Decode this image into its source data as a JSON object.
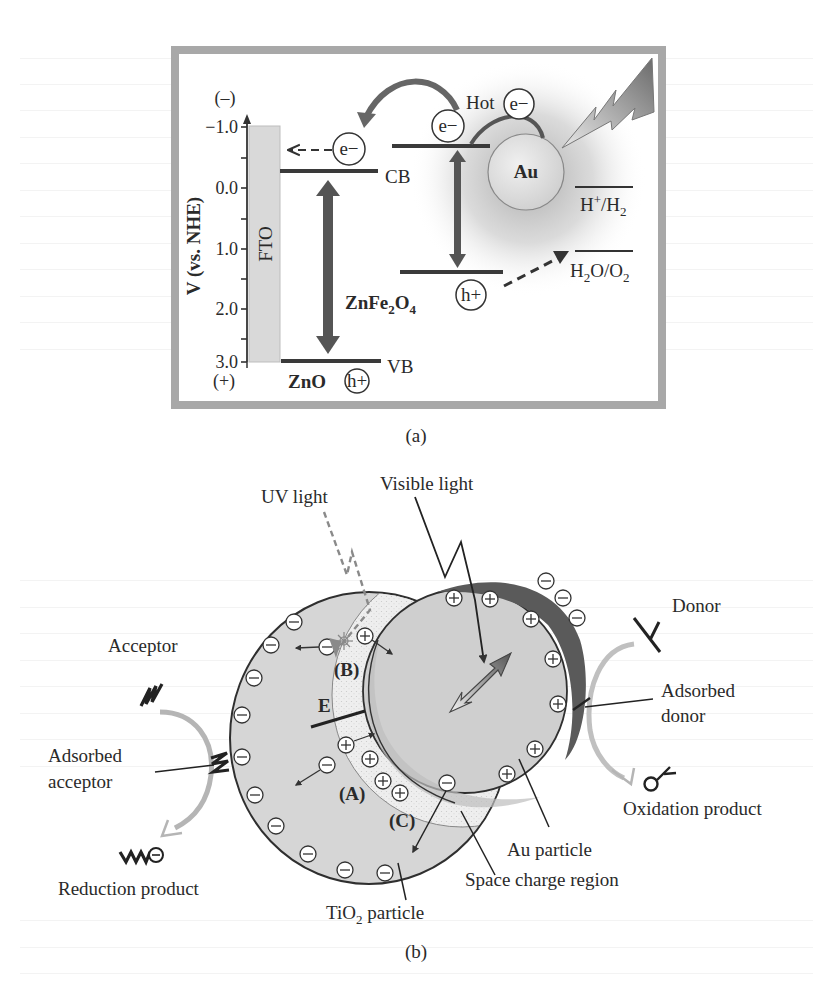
{
  "panel_a": {
    "caption": "(a)",
    "axis": {
      "label": "V (vs. NHE)",
      "top_sign": "(–)",
      "bottom_sign": "(+)",
      "ticks": [
        "−1.0",
        "0.0",
        "1.0",
        "2.0",
        "3.0"
      ]
    },
    "fto_label": "FTO",
    "zno": {
      "label": "ZnO",
      "cb_label": "CB",
      "vb_label": "VB",
      "hole": "h+",
      "electron": "e−"
    },
    "znfe2o4": {
      "label_main": "ZnFe",
      "label_sub1": "2",
      "label_o": "O",
      "label_sub2": "4",
      "electron": "e−",
      "hole": "h+"
    },
    "au": {
      "label": "Au",
      "hot_label": "Hot",
      "hot_electron": "e−"
    },
    "redox": {
      "h_label": "H+/H2",
      "h_plus": "H",
      "h_sup": "+",
      "h_slash": "/H",
      "h_sub": "2",
      "o_label": "H2O/O2",
      "o_h": "H",
      "o_sub1": "2",
      "o_mid": "O/O",
      "o_sub2": "2"
    }
  },
  "panel_b": {
    "caption": "(b)",
    "labels": {
      "uv_light": "UV light",
      "visible_light": "Visible light",
      "acceptor": "Acceptor",
      "adsorbed_acceptor_1": "Adsorbed",
      "adsorbed_acceptor_2": "acceptor",
      "reduction_product": "Reduction product",
      "donor": "Donor",
      "adsorbed_donor_1": "Adsorbed",
      "adsorbed_donor_2": "donor",
      "oxidation_product": "Oxidation product",
      "au_particle": "Au particle",
      "space_charge_region": "Space charge region",
      "tio2_particle_ti": "TiO",
      "tio2_particle_sub": "2",
      "tio2_particle_rest": " particle",
      "region_a": "(A)",
      "region_b": "(B)",
      "region_c": "(C)",
      "field": "E"
    }
  },
  "colors": {
    "frame": "#a8a8a8",
    "fto": "#d9d9d9",
    "level_line": "#3a3a3a",
    "arrow_dark": "#555555",
    "tio2_fill": "#d6d6d6",
    "space_charge_fill": "#ebebeb",
    "au_fill": "#cfcfcf",
    "au_dark_crescent": "#5a5a5a"
  }
}
